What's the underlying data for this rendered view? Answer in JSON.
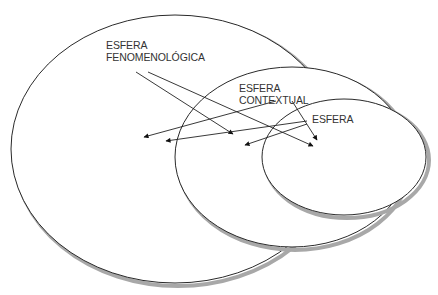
{
  "diagram": {
    "type": "nested-ellipses",
    "colors": {
      "stroke": "#2a2a2a",
      "shadow": "#9a9a9a",
      "fill": "#ffffff",
      "text": "#333333"
    },
    "ellipses": [
      {
        "id": "fenomenologica",
        "cx": 175,
        "cy": 149,
        "rx": 164,
        "ry": 134
      },
      {
        "id": "contextual",
        "cx": 292,
        "cy": 157,
        "rx": 117,
        "ry": 90
      },
      {
        "id": "inner",
        "cx": 344,
        "cy": 157,
        "rx": 82,
        "ry": 58
      }
    ],
    "labels": {
      "fenomenologica": {
        "line1": "ESFERA",
        "line2": "FENOMENOLÓGICA"
      },
      "contextual": {
        "line1": "ESFERA",
        "line2": "CONTEXTUAL"
      },
      "inner": {
        "line1": "ESFERA"
      }
    },
    "arrows": [
      {
        "from": "fenomenologica",
        "x1": 136,
        "y1": 72,
        "x2": 233,
        "y2": 134
      },
      {
        "from": "fenomenologica",
        "x1": 148,
        "y1": 72,
        "x2": 313,
        "y2": 146
      },
      {
        "from": "contextual",
        "x1": 276,
        "y1": 101,
        "x2": 144,
        "y2": 137
      },
      {
        "from": "contextual",
        "x1": 292,
        "y1": 101,
        "x2": 317,
        "y2": 140
      },
      {
        "from": "inner",
        "x1": 307,
        "y1": 121,
        "x2": 166,
        "y2": 141
      },
      {
        "from": "inner",
        "x1": 307,
        "y1": 124,
        "x2": 245,
        "y2": 145
      }
    ]
  }
}
